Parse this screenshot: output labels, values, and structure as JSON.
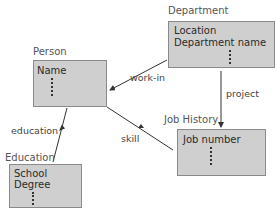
{
  "entities": {
    "department": {
      "name": "Department",
      "attributes": [
        "Location",
        "Department name"
      ],
      "more": "⋮"
    },
    "person": {
      "name": "Person",
      "attributes": [
        "Name"
      ],
      "more": "⋮"
    },
    "job_history": {
      "name": "Job History",
      "attributes": [
        "Job number"
      ],
      "more": "⋮"
    },
    "education": {
      "name": "Education",
      "attributes": [
        "School",
        "Degree"
      ],
      "more": "⋮"
    }
  },
  "relationships": [
    {
      "label": "work-in",
      "from": "Department",
      "to": "Person"
    },
    {
      "label": "project",
      "from": "Department",
      "to": "Job History"
    },
    {
      "label": "skill",
      "from": "Person",
      "to": "Job History"
    },
    {
      "label": "education",
      "from": "Person",
      "to": "Education"
    }
  ],
  "colors": {
    "box_fill": "#cfcfcf",
    "box_border": "#8a8a8a",
    "line": "#333333"
  }
}
